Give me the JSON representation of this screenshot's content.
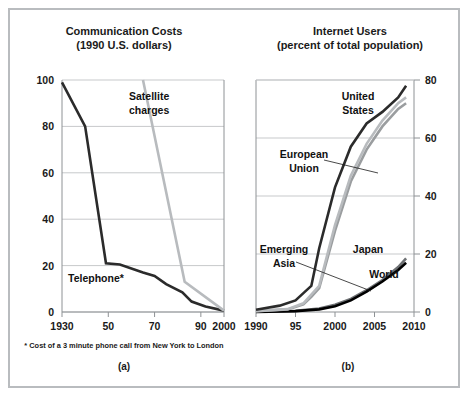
{
  "figure": {
    "panel_a_tag": "(a)",
    "panel_b_tag": "(b)",
    "footnote": "* Cost of a 3 minute phone call from New York to London"
  },
  "colors": {
    "dark_line": "#2b2b2b",
    "black_line": "#000000",
    "mid_gray_line": "#6e7174",
    "light_gray_line": "#b8bbbe",
    "grid": "#c7c9cb",
    "axis": "#8e9295",
    "frame": "#b9bcbf",
    "text": "#1a1a1a",
    "background": "#ffffff"
  },
  "chart_data": [
    {
      "type": "line",
      "title": "Communication Costs",
      "subtitle": "(1990 U.S. dollars)",
      "xlabel": "",
      "ylabel": "",
      "xlim": [
        1930,
        2000
      ],
      "ylim": [
        0,
        100
      ],
      "xticks": [
        1930,
        1950,
        1970,
        1990,
        2000
      ],
      "xticklabels": [
        "1930",
        "50",
        "70",
        "90",
        "2000"
      ],
      "yticks": [
        0,
        20,
        40,
        60,
        80,
        100
      ],
      "yticklabels": [
        "0",
        "20",
        "40",
        "60",
        "80",
        "100"
      ],
      "yaxis_side": "left",
      "grid": true,
      "legend": "inline-annotations",
      "annotations": [
        {
          "text": "Satellite\ncharges",
          "line1": "Satellite",
          "line2": "charges",
          "series": "Satellite charges"
        },
        {
          "text": "Telephone*",
          "line1": "Telephone*",
          "line2": "",
          "series": "Telephone"
        }
      ],
      "series": [
        {
          "name": "Telephone",
          "color": "#2b2b2b",
          "width": 2.6,
          "x": [
            1930,
            1940,
            1949,
            1955,
            1965,
            1970,
            1975,
            1982,
            1986,
            1992,
            2000
          ],
          "y": [
            99,
            80,
            21,
            20.5,
            17,
            15.5,
            12,
            8.5,
            4.5,
            2.4,
            0.6
          ]
        },
        {
          "name": "Satellite charges",
          "color": "#b8bbbe",
          "width": 2.6,
          "x": [
            1965,
            1983,
            2000
          ],
          "y": [
            100,
            13,
            0.6
          ]
        }
      ]
    },
    {
      "type": "line",
      "title": "Internet Users",
      "subtitle": "(percent of total population)",
      "xlabel": "",
      "ylabel": "",
      "xlim": [
        1990,
        2010
      ],
      "ylim": [
        0,
        80
      ],
      "xticks": [
        1990,
        1995,
        2000,
        2005,
        2010
      ],
      "xticklabels": [
        "1990",
        "95",
        "2000",
        "2005",
        "2010"
      ],
      "yticks": [
        0,
        20,
        40,
        60,
        80
      ],
      "yticklabels": [
        "0",
        "20",
        "40",
        "60",
        "80"
      ],
      "yaxis_side": "right",
      "grid": true,
      "legend": "inline-annotations",
      "annotations": [
        {
          "text": "United States",
          "line1": "United",
          "line2": "States",
          "series": "United States"
        },
        {
          "text": "European Union",
          "line1": "European",
          "line2": "Union",
          "series": "European Union"
        },
        {
          "text": "Emerging Asia",
          "line1": "Emerging",
          "line2": "Asia",
          "series": "Emerging Asia"
        },
        {
          "text": "Japan",
          "line1": "Japan",
          "line2": "",
          "series": "Japan"
        },
        {
          "text": "World",
          "line1": "World",
          "line2": "",
          "series": "World"
        }
      ],
      "series": [
        {
          "name": "United States",
          "color": "#2b2b2b",
          "width": 2.6,
          "x": [
            1990,
            1993,
            1995,
            1996,
            1997,
            1998,
            2000,
            2002,
            2004,
            2006,
            2008,
            2009
          ],
          "y": [
            0.8,
            2.2,
            4.0,
            6.5,
            9.0,
            22,
            43,
            57,
            65,
            69,
            74,
            78
          ]
        },
        {
          "name": "Japan",
          "color": "#b8bbbe",
          "width": 2.6,
          "x": [
            1990,
            1994,
            1996,
            1997,
            1998,
            2000,
            2002,
            2004,
            2006,
            2008,
            2009
          ],
          "y": [
            0.3,
            1.0,
            3.0,
            6.0,
            9.0,
            30,
            47,
            58,
            66,
            72,
            74
          ]
        },
        {
          "name": "European Union",
          "color": "#9a9d9f",
          "width": 2.6,
          "x": [
            1990,
            1994,
            1996,
            1997,
            1998,
            2000,
            2002,
            2004,
            2006,
            2008,
            2009
          ],
          "y": [
            0.3,
            0.9,
            2.6,
            5.2,
            8.2,
            28,
            45,
            56,
            64,
            70,
            72
          ]
        },
        {
          "name": "Emerging Asia",
          "color": "#6e7174",
          "width": 2.6,
          "x": [
            1990,
            1995,
            1998,
            2000,
            2002,
            2004,
            2006,
            2008,
            2009
          ],
          "y": [
            0.1,
            0.4,
            1.2,
            2.5,
            4.5,
            7.5,
            11.0,
            15.5,
            18.5
          ]
        },
        {
          "name": "World",
          "color": "#000000",
          "width": 2.6,
          "x": [
            1990,
            1995,
            1998,
            2000,
            2002,
            2004,
            2006,
            2008,
            2009
          ],
          "y": [
            0.05,
            0.3,
            0.9,
            2.0,
            4.0,
            7.0,
            10.5,
            14.5,
            17.0
          ]
        }
      ]
    }
  ]
}
